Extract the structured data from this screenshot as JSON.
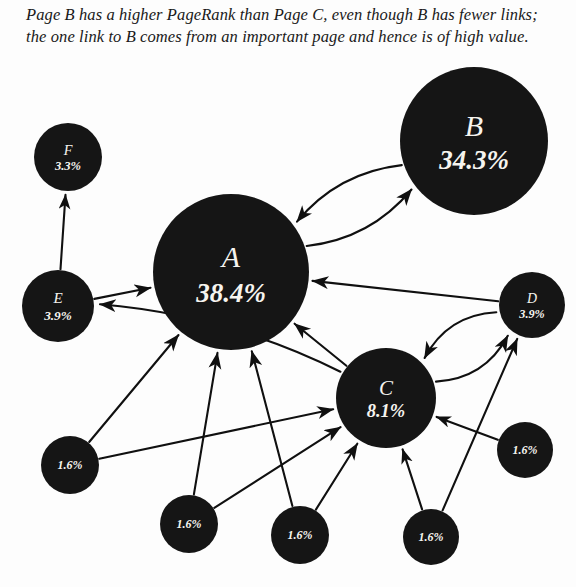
{
  "caption": {
    "text": "Page B has a higher PageRank than Page C, even though B has fewer links; the one link to B comes from an important page and hence is of high value."
  },
  "colors": {
    "node_fill": "#151515",
    "edge": "#101010",
    "label": "#f6f4ef",
    "background": "#fdfdfd"
  },
  "chart_data": {
    "type": "diagram",
    "nodes": [
      {
        "id": "A",
        "name": "A",
        "value": "38.4%",
        "percent": 38.4,
        "cx": 231,
        "cy": 272,
        "r": 78
      },
      {
        "id": "B",
        "name": "B",
        "value": "34.3%",
        "percent": 34.3,
        "cx": 474,
        "cy": 141,
        "r": 74
      },
      {
        "id": "C",
        "name": "C",
        "value": "8.1%",
        "percent": 8.1,
        "cx": 386,
        "cy": 398,
        "r": 50
      },
      {
        "id": "D",
        "name": "D",
        "value": "3.9%",
        "percent": 3.9,
        "cx": 532,
        "cy": 305,
        "r": 33
      },
      {
        "id": "E",
        "name": "E",
        "value": "3.9%",
        "percent": 3.9,
        "cx": 58,
        "cy": 306,
        "r": 36
      },
      {
        "id": "F",
        "name": "F",
        "value": "3.3%",
        "percent": 3.3,
        "cx": 68,
        "cy": 157,
        "r": 34
      },
      {
        "id": "G",
        "name": "",
        "value": "1.6%",
        "percent": 1.6,
        "cx": 70,
        "cy": 465,
        "r": 29
      },
      {
        "id": "H",
        "name": "",
        "value": "1.6%",
        "percent": 1.6,
        "cx": 189,
        "cy": 524,
        "r": 29
      },
      {
        "id": "I",
        "name": "",
        "value": "1.6%",
        "percent": 1.6,
        "cx": 300,
        "cy": 535,
        "r": 29
      },
      {
        "id": "J",
        "name": "",
        "value": "1.6%",
        "percent": 1.6,
        "cx": 431,
        "cy": 537,
        "r": 28
      },
      {
        "id": "K",
        "name": "",
        "value": "1.6%",
        "percent": 1.6,
        "cx": 525,
        "cy": 450,
        "r": 28
      }
    ],
    "edges": [
      {
        "from": "A",
        "to": "B",
        "style": "curved"
      },
      {
        "from": "B",
        "to": "A",
        "style": "curved"
      },
      {
        "from": "C",
        "to": "D",
        "style": "curved"
      },
      {
        "from": "D",
        "to": "C",
        "style": "curved"
      },
      {
        "from": "D",
        "to": "A",
        "style": "straight"
      },
      {
        "from": "C",
        "to": "A",
        "style": "straight"
      },
      {
        "from": "C",
        "to": "E",
        "style": "curved"
      },
      {
        "from": "E",
        "to": "A",
        "style": "straight"
      },
      {
        "from": "E",
        "to": "F",
        "style": "straight"
      },
      {
        "from": "G",
        "to": "A",
        "style": "straight"
      },
      {
        "from": "G",
        "to": "C",
        "style": "straight"
      },
      {
        "from": "H",
        "to": "A",
        "style": "straight"
      },
      {
        "from": "H",
        "to": "C",
        "style": "straight"
      },
      {
        "from": "I",
        "to": "A",
        "style": "straight"
      },
      {
        "from": "I",
        "to": "C",
        "style": "straight"
      },
      {
        "from": "J",
        "to": "C",
        "style": "straight"
      },
      {
        "from": "K",
        "to": "C",
        "style": "straight"
      },
      {
        "from": "J",
        "to": "D",
        "style": "straight"
      }
    ]
  }
}
